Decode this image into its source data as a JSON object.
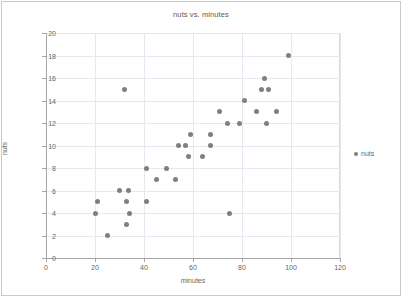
{
  "chart_data": {
    "type": "scatter",
    "title": "nuts vs. minutes",
    "xlabel": "minutes",
    "ylabel": "nuts",
    "xlim": [
      0,
      120
    ],
    "ylim": [
      0,
      20
    ],
    "xticks": [
      0,
      20,
      40,
      60,
      80,
      100,
      120
    ],
    "yticks": [
      0,
      2,
      4,
      6,
      8,
      10,
      12,
      14,
      16,
      18,
      20
    ],
    "grid": "horizontal-and-vertical",
    "legend": {
      "position": "right",
      "entries": [
        {
          "label": "nuts",
          "color": "#7f7f7f",
          "marker": "circle"
        }
      ]
    },
    "series": [
      {
        "name": "nuts",
        "color": "#7f7f7f",
        "points": [
          {
            "x": 20,
            "y": 4
          },
          {
            "x": 21,
            "y": 5
          },
          {
            "x": 25,
            "y": 2
          },
          {
            "x": 30,
            "y": 6
          },
          {
            "x": 32,
            "y": 15
          },
          {
            "x": 33,
            "y": 3
          },
          {
            "x": 33,
            "y": 5
          },
          {
            "x": 33.5,
            "y": 6
          },
          {
            "x": 34,
            "y": 4
          },
          {
            "x": 41,
            "y": 8
          },
          {
            "x": 41,
            "y": 5
          },
          {
            "x": 45,
            "y": 7
          },
          {
            "x": 49,
            "y": 8
          },
          {
            "x": 53,
            "y": 7
          },
          {
            "x": 54,
            "y": 10
          },
          {
            "x": 57,
            "y": 10
          },
          {
            "x": 58,
            "y": 9
          },
          {
            "x": 59,
            "y": 11
          },
          {
            "x": 64,
            "y": 9
          },
          {
            "x": 67,
            "y": 11
          },
          {
            "x": 67,
            "y": 10
          },
          {
            "x": 71,
            "y": 13
          },
          {
            "x": 74,
            "y": 12
          },
          {
            "x": 75,
            "y": 4
          },
          {
            "x": 79,
            "y": 12
          },
          {
            "x": 81,
            "y": 14
          },
          {
            "x": 86,
            "y": 13
          },
          {
            "x": 88,
            "y": 15
          },
          {
            "x": 89,
            "y": 16
          },
          {
            "x": 90,
            "y": 12
          },
          {
            "x": 91,
            "y": 15
          },
          {
            "x": 94,
            "y": 13
          },
          {
            "x": 99,
            "y": 18
          }
        ]
      }
    ]
  }
}
